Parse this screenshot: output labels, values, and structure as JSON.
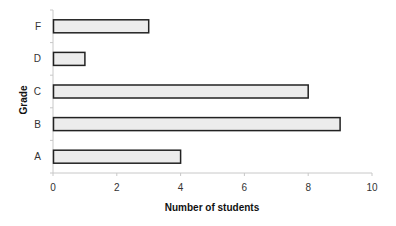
{
  "chart_data": {
    "type": "bar",
    "orientation": "horizontal",
    "title": "",
    "xlabel": "Number of students",
    "ylabel": "Grade",
    "categories": [
      "A",
      "B",
      "C",
      "D",
      "F"
    ],
    "values": [
      4,
      9,
      8,
      1,
      3
    ],
    "xlim": [
      0,
      10
    ],
    "x_ticks": [
      0,
      2,
      4,
      6,
      8,
      10
    ],
    "grid": false,
    "legend": null,
    "colors": {
      "bar_fill": "#ececec",
      "bar_stroke": "#222222",
      "axis": "#c8c8c8"
    }
  }
}
